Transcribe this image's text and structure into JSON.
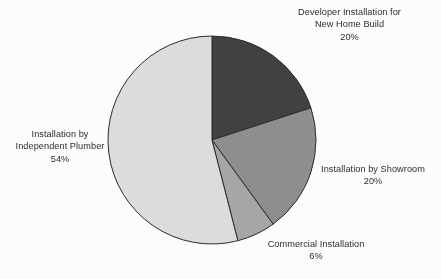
{
  "chart_data": {
    "type": "pie",
    "title": "",
    "subtitle": "",
    "xlabel": "",
    "ylabel": "",
    "legend_position": "none",
    "grid": false,
    "start_angle_deg": 0,
    "direction": "clockwise",
    "categories": [
      "Developer Installation for New Home Build",
      "Installation by Showroom",
      "Commercial Installation",
      "Installation by Independent Plumber"
    ],
    "values": [
      20,
      20,
      6,
      54
    ],
    "value_unit": "%",
    "colors": [
      "#3f3f3f",
      "#8e8e8e",
      "#a6a6a6",
      "#dcdcdc"
    ],
    "slice_edge_color": "#2a2a2a",
    "slices": [
      {
        "name": "Developer Installation for New Home Build",
        "value": 20,
        "value_label": "20%",
        "color": "#3f3f3f",
        "start_deg": 0,
        "end_deg": 72
      },
      {
        "name": "Installation by Showroom",
        "value": 20,
        "value_label": "20%",
        "color": "#8e8e8e",
        "start_deg": 72,
        "end_deg": 144
      },
      {
        "name": "Commercial Installation",
        "value": 6,
        "value_label": "6%",
        "color": "#a6a6a6",
        "start_deg": 144,
        "end_deg": 165.6
      },
      {
        "name": "Installation by Independent Plumber",
        "value": 54,
        "value_label": "54%",
        "color": "#dcdcdc",
        "start_deg": 165.6,
        "end_deg": 360
      }
    ]
  },
  "labels": {
    "developer": {
      "line1": "Developer Installation for",
      "line2": "New Home Build",
      "value": "20%"
    },
    "showroom": {
      "line1": "Installation by Showroom",
      "value": "20%"
    },
    "commercial": {
      "line1": "Commercial Installation",
      "value": "6%"
    },
    "plumber": {
      "line1": "Installation by",
      "line2": "Independent Plumber",
      "value": "54%"
    }
  },
  "figure": {
    "background_color": "#fdfdfd",
    "text_color": "#2b2b2b",
    "center_x": 212,
    "center_y": 140,
    "radius": 104
  }
}
